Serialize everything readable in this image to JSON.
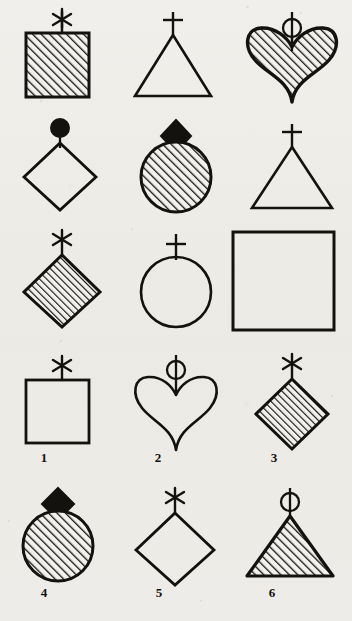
{
  "figure": {
    "background_color": "#efeeea",
    "ink_color": "#14120f",
    "fill_style": "diagonal-hatch",
    "hatch_direction": "bottom-left-to-top-right",
    "matrix": {
      "rows": 3,
      "columns": 3,
      "cells": [
        {
          "row": 1,
          "col": 1,
          "shape": "square",
          "fill": "hatched",
          "finial": "asterisk"
        },
        {
          "row": 1,
          "col": 2,
          "shape": "triangle",
          "fill": "outline",
          "finial": "cross"
        },
        {
          "row": 1,
          "col": 3,
          "shape": "heart",
          "fill": "hatched",
          "finial": "circle"
        },
        {
          "row": 2,
          "col": 1,
          "shape": "diamond",
          "fill": "outline",
          "finial": "filled-circle"
        },
        {
          "row": 2,
          "col": 2,
          "shape": "circle",
          "fill": "hatched",
          "finial": "filled-diamond"
        },
        {
          "row": 2,
          "col": 3,
          "shape": "triangle",
          "fill": "outline",
          "finial": "cross"
        },
        {
          "row": 3,
          "col": 1,
          "shape": "diamond",
          "fill": "hatched",
          "finial": "asterisk"
        },
        {
          "row": 3,
          "col": 2,
          "shape": "circle",
          "fill": "outline",
          "finial": "cross"
        },
        {
          "row": 3,
          "col": 3,
          "shape": "square",
          "fill": "outline",
          "finial": "none"
        }
      ]
    },
    "options": [
      {
        "number": "1",
        "shape": "square",
        "fill": "outline",
        "finial": "asterisk"
      },
      {
        "number": "2",
        "shape": "heart",
        "fill": "outline",
        "finial": "circle"
      },
      {
        "number": "3",
        "shape": "diamond",
        "fill": "hatched",
        "finial": "asterisk"
      },
      {
        "number": "4",
        "shape": "circle",
        "fill": "hatched",
        "finial": "filled-diamond"
      },
      {
        "number": "5",
        "shape": "diamond",
        "fill": "outline",
        "finial": "asterisk"
      },
      {
        "number": "6",
        "shape": "triangle",
        "fill": "hatched",
        "finial": "circle"
      }
    ],
    "option_labels": [
      "1",
      "2",
      "3",
      "4",
      "5",
      "6"
    ]
  }
}
